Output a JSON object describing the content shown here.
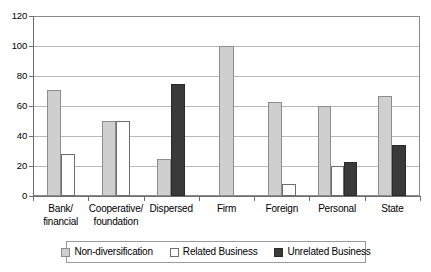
{
  "chart_data": {
    "type": "bar",
    "title": "",
    "subtitle": "",
    "xlabel": "",
    "ylabel": "",
    "ylim": [
      0,
      120
    ],
    "yticks": [
      0,
      20,
      40,
      60,
      80,
      100,
      120
    ],
    "ytick_labels": [
      "0",
      "20",
      "40",
      "60",
      "80",
      "100",
      "120"
    ],
    "grid": true,
    "legend_position": "bottom",
    "categories": [
      "Bank/ financial",
      "Cooperative/ foundation",
      "Dispersed",
      "Firm",
      "Foreign",
      "Personal",
      "State"
    ],
    "category_lines": [
      [
        "Bank/",
        "financial"
      ],
      [
        "Cooperative/",
        "foundation"
      ],
      [
        "Dispersed"
      ],
      [
        "Firm"
      ],
      [
        "Foreign"
      ],
      [
        "Personal"
      ],
      [
        "State"
      ]
    ],
    "series": [
      {
        "name": "Non-diversification",
        "color": "#cfcfcf",
        "values": [
          71,
          50,
          25,
          100,
          63,
          60,
          67
        ]
      },
      {
        "name": "Related Business",
        "color": "#ffffff",
        "values": [
          28,
          50,
          0,
          0,
          8,
          20,
          0
        ]
      },
      {
        "name": "Unrelated Business",
        "color": "#3a3a3a",
        "values": [
          0,
          0,
          75,
          0,
          0,
          23,
          34
        ]
      }
    ]
  },
  "legend": {
    "items": [
      {
        "label": "Non-diversification",
        "swatch": "legend-swatch-non-diversification"
      },
      {
        "label": "Related Business",
        "swatch": "legend-swatch-related-business"
      },
      {
        "label": "Unrelated Business",
        "swatch": "legend-swatch-unrelated-business"
      }
    ]
  }
}
